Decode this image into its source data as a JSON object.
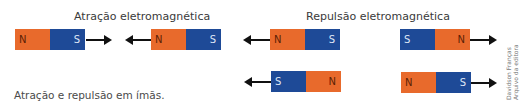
{
  "titles": {
    "attraction": "Atração eletromagnética",
    "repulsion": "Repulsão eletromagnética"
  },
  "caption": "Atração e repulsão em ímãs.",
  "credit": {
    "line1": "Davidson Franças",
    "line2": "Arquivo da editora"
  },
  "poles": {
    "north": "N",
    "south": "S"
  },
  "colors": {
    "north": "#E86A2C",
    "south": "#1E4A97",
    "arrow": "#111111"
  },
  "magnets": [
    {
      "id": 1,
      "group": "attraction",
      "left": "N",
      "right": "S",
      "arrow": "right-of-magnet pointing right"
    },
    {
      "id": 2,
      "group": "attraction",
      "left": "N",
      "right": "S",
      "arrow": "left-of-magnet pointing left"
    },
    {
      "id": 3,
      "group": "repulsion",
      "left": "N",
      "right": "S",
      "arrow": "left-of-magnet pointing left"
    },
    {
      "id": 4,
      "group": "repulsion",
      "left": "S",
      "right": "N",
      "arrow": "right-of-magnet pointing right"
    },
    {
      "id": 5,
      "group": "repulsion",
      "left": "S",
      "right": "N",
      "arrow": "left-of-magnet pointing left"
    },
    {
      "id": 6,
      "group": "repulsion",
      "left": "N",
      "right": "S",
      "arrow": "right-of-magnet pointing right"
    }
  ]
}
